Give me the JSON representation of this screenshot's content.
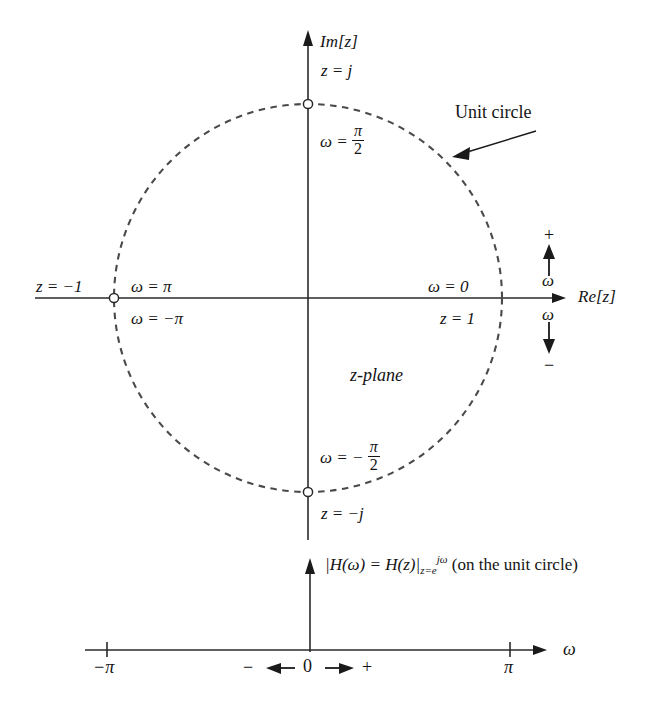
{
  "figure": {
    "kind": "z-plane unit circle diagram with frequency axis",
    "plane_label": "z-plane",
    "unit_circle_label": "Unit circle",
    "axes": {
      "imaginary_label": "Im[z]",
      "real_label": "Re[z]",
      "omega_axis_label": "ω"
    },
    "circle_points": {
      "top": {
        "point": "z = j",
        "omega_num": "π",
        "omega_den": "2",
        "omega_prefix": "ω ="
      },
      "bottom": {
        "point": "z = −j",
        "omega_num": "π",
        "omega_den": "2",
        "omega_prefix": "ω = −"
      },
      "right": {
        "point": "z = 1",
        "omega": "ω = 0"
      },
      "left": {
        "point": "z = −1",
        "omega_upper": "ω = π",
        "omega_lower": "ω = −π"
      }
    },
    "omega_direction": {
      "plus_sign": "+",
      "minus_sign": "−",
      "up_label": "ω",
      "down_label": "ω"
    },
    "lower_plot": {
      "magnitude_label_parts": {
        "lead": "|H(ω) = H(z)|",
        "sub": "z=e",
        "sup": "jω",
        "trail": "(on the unit circle)"
      },
      "axis_label": "ω",
      "ticks": [
        {
          "label": "−π",
          "x_value": -3.14159
        },
        {
          "label": "π",
          "x_value": 3.14159
        }
      ],
      "origin_row": {
        "minus": "−",
        "left_arrow": "←",
        "zero": "0",
        "right_arrow": "→",
        "plus": "+"
      }
    },
    "colors": {
      "ink": "#141414",
      "axis": "#2a2a2a",
      "circle": "#4a4a4a",
      "background": "#ffffff"
    }
  }
}
